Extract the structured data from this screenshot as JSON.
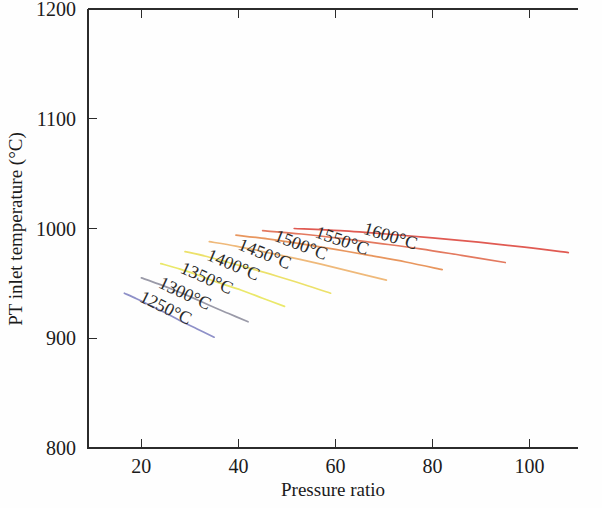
{
  "chart_data": {
    "type": "line",
    "title": "",
    "xlabel": "Pressure ratio",
    "ylabel": "PT inlet temperature (°C)",
    "xlim": [
      9,
      110
    ],
    "ylim": [
      800,
      1200
    ],
    "xticks": [
      "20",
      "40",
      "60",
      "80",
      "100"
    ],
    "xtick_values": [
      20,
      40,
      60,
      80,
      100
    ],
    "yticks": [
      "800",
      "900",
      "1000",
      "1100",
      "1200"
    ],
    "ytick_values": [
      800,
      900,
      1000,
      1100,
      1200
    ],
    "grid": false,
    "legend": "inline-curve-labels",
    "series": [
      {
        "name": "1250°C",
        "label": "1250°C",
        "color": "#8e90c8",
        "label_x": 24.5,
        "label_y": 923,
        "label_rotation": 26,
        "x": [
          16.5,
          19,
          22,
          25,
          28,
          31.5,
          35
        ],
        "y": [
          941,
          936,
          929.5,
          923,
          916,
          908.5,
          901
        ]
      },
      {
        "name": "1300°C",
        "label": "1300°C",
        "color": "#9a9aa8",
        "label_x": 28.5,
        "label_y": 936,
        "label_rotation": 25,
        "x": [
          20,
          23.5,
          27,
          30.5,
          34,
          38,
          42
        ],
        "y": [
          955,
          949.5,
          943.5,
          937,
          930,
          922.5,
          915
        ]
      },
      {
        "name": "1350°C",
        "label": "1350°C",
        "color": "#eae86a",
        "label_x": 33,
        "label_y": 950,
        "label_rotation": 24,
        "x": [
          24,
          28,
          32,
          36,
          40.5,
          45,
          49.5
        ],
        "y": [
          968,
          963,
          957,
          950.5,
          944,
          936.5,
          929
        ]
      },
      {
        "name": "1400°C",
        "label": "1400°C",
        "color": "#ece16a",
        "label_x": 38.5,
        "label_y": 962,
        "label_rotation": 23,
        "x": [
          29,
          33.5,
          38,
          43,
          48,
          53.5,
          59
        ],
        "y": [
          979,
          974.5,
          969,
          963,
          956.5,
          949,
          941
        ]
      },
      {
        "name": "1450°C",
        "label": "1450°C",
        "color": "#efb97a",
        "label_x": 45,
        "label_y": 972,
        "label_rotation": 22,
        "x": [
          34,
          39.5,
          45,
          51,
          57,
          63.5,
          70.5
        ],
        "y": [
          988,
          984,
          979,
          973.5,
          967.5,
          960.5,
          953
        ]
      },
      {
        "name": "1500°C",
        "label": "1500°C",
        "color": "#e8965e",
        "label_x": 52.5,
        "label_y": 980,
        "label_rotation": 21,
        "x": [
          39.5,
          46,
          53,
          60,
          67,
          74.5,
          82
        ],
        "y": [
          994,
          990.5,
          986,
          981,
          975.5,
          969.5,
          962.5
        ]
      },
      {
        "name": "1550°C",
        "label": "1550°C",
        "color": "#e3795f",
        "label_x": 61,
        "label_y": 984,
        "label_rotation": 19,
        "x": [
          45,
          53,
          61,
          69,
          77.5,
          86,
          95
        ],
        "y": [
          998,
          995,
          991,
          986.5,
          981.5,
          975.5,
          969
        ]
      },
      {
        "name": "1600°C",
        "label": "1600°C",
        "color": "#e05a52",
        "label_x": 71,
        "label_y": 988,
        "label_rotation": 17,
        "x": [
          51.5,
          61,
          70.5,
          80,
          89.5,
          99,
          108
        ],
        "y": [
          1000,
          998,
          995,
          991.5,
          987.5,
          983,
          978
        ]
      }
    ]
  }
}
